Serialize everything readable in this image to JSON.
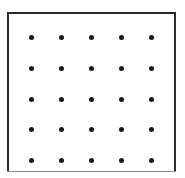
{
  "figure": {
    "canvas": {
      "width": 185,
      "height": 178,
      "background": "#ffffff"
    },
    "frame": {
      "x": 7,
      "y": 12,
      "width": 169,
      "height": 160,
      "fill": "#ffffff",
      "border_color": "#2b2b2b",
      "border_width": 2,
      "bottom_border_color": "#8d8d8d",
      "bottom_border_width": 1
    },
    "dots": {
      "rows": 5,
      "columns": 5,
      "count": 25,
      "diameter": 5,
      "color": "#181818",
      "shape": "circle",
      "x_positions": [
        31,
        61,
        91,
        121,
        151
      ],
      "y_positions": [
        37,
        68,
        99,
        129,
        160
      ],
      "x_spacing": 30,
      "y_spacing": 30.75
    }
  },
  "chart_data": {
    "type": "scatter",
    "title": "",
    "xlabel": "",
    "ylabel": "",
    "grid": false,
    "legend": null,
    "xlim": [
      0,
      6
    ],
    "ylim": [
      0,
      6
    ],
    "series": [
      {
        "name": "grid-points",
        "marker": "filled-circle",
        "color": "#181818",
        "size": 5,
        "x": [
          1,
          2,
          3,
          4,
          5,
          1,
          2,
          3,
          4,
          5,
          1,
          2,
          3,
          4,
          5,
          1,
          2,
          3,
          4,
          5,
          1,
          2,
          3,
          4,
          5
        ],
        "y": [
          5,
          5,
          5,
          5,
          5,
          4,
          4,
          4,
          4,
          4,
          3,
          3,
          3,
          3,
          3,
          2,
          2,
          2,
          2,
          2,
          1,
          1,
          1,
          1,
          1
        ]
      }
    ]
  }
}
